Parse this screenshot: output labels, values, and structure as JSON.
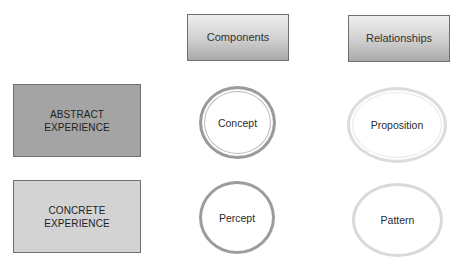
{
  "columns": {
    "components": "Components",
    "relationships": "Relationships"
  },
  "rows": {
    "abstract": {
      "line1": "ABSTRACT",
      "line2": "EXPERIENCE"
    },
    "concrete": {
      "line1": "CONCRETE",
      "line2": "EXPERIENCE"
    }
  },
  "nodes": {
    "concept": "Concept",
    "proposition": "Proposition",
    "percept": "Percept",
    "pattern": "Pattern"
  },
  "colors": {
    "abstract_fill": "#a4a4a4",
    "concrete_fill": "#d3d3d3",
    "dark_outline": "#9a9a9a",
    "light_outline": "#dcdcdc"
  }
}
